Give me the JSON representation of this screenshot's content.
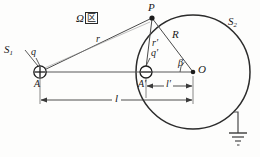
{
  "figure": {
    "title_label": "Ω",
    "region_char": "区",
    "background_color": "#fdfdfc",
    "stroke_color": "#2b2b2b"
  },
  "labels": {
    "source_surface": "S",
    "source_surface_sub": "1",
    "sphere_surface": "S",
    "sphere_surface_sub": "2",
    "field_point": "P",
    "center_point": "O",
    "charge_point": "A",
    "image_charge_point": "A′",
    "charge": "q",
    "image_charge": "q′",
    "distance_r": "r",
    "distance_r_prime": "r′",
    "radius_R": "R",
    "angle_beta": "β",
    "distance_l": "l",
    "distance_l_prime": "l′"
  },
  "geometry": {
    "circle_center_x": 193,
    "circle_center_y": 72,
    "circle_radius": 57,
    "point_A_x": 40,
    "point_A_y": 72,
    "point_A_prime_x": 146,
    "point_A_prime_y": 72,
    "point_P_x": 152,
    "point_P_y": 18,
    "ground_x": 238,
    "ground_y": 145
  },
  "symbols": {
    "positive_charge": "⊕",
    "negative_charge": "⊖",
    "ground": "ground-symbol"
  }
}
